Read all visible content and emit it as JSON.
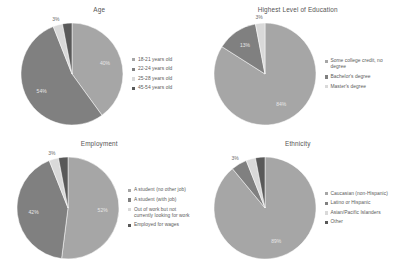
{
  "page": {
    "background": "#ffffff",
    "layout": "2x2 grid of pie charts"
  },
  "palette": {
    "series_1": "#a6a6a6",
    "series_2": "#808080",
    "series_3": "#d9d9d9",
    "series_4": "#595959",
    "title_color": "#555555",
    "legend_text_color": "#5a5a5a",
    "inside_label_color": "#e8e8e8",
    "outside_label_color": "#6a6a6a"
  },
  "charts": [
    {
      "id": "age",
      "title": "Age",
      "legend": [
        "18-21 years old",
        "22-24 years old",
        "25-28 years old",
        "45-54 years old"
      ],
      "labels": [
        "40%",
        "54%",
        "3%",
        ""
      ],
      "values": [
        40,
        54,
        3,
        3
      ]
    },
    {
      "id": "education",
      "title": "Highest Level of Education",
      "legend": [
        "Some college credit, no degree",
        "Bachelor's degree",
        "Master's degree"
      ],
      "labels": [
        "84%",
        "13%",
        "3%"
      ],
      "values": [
        84,
        13,
        3
      ]
    },
    {
      "id": "employment",
      "title": "Employment",
      "legend": [
        "A student (no other job)",
        "A student (with job)",
        "Out of work but not currently looking for work",
        "Employed for wages"
      ],
      "labels": [
        "52%",
        "42%",
        "3%",
        ""
      ],
      "values": [
        52,
        42,
        3,
        3
      ]
    },
    {
      "id": "ethnicity",
      "title": "Ethnicity",
      "legend": [
        "Caucasian (non-Hispanic)",
        "Latino or Hispanic",
        "Asian/Pacific Islanders",
        "Other"
      ],
      "labels": [
        "89%",
        "3%",
        "",
        ""
      ],
      "values": [
        89,
        5,
        3,
        3
      ]
    }
  ],
  "chart_data": [
    {
      "type": "pie",
      "title": "Age",
      "categories": [
        "18-21 years old",
        "22-24 years old",
        "25-28 years old",
        "45-54 years old"
      ],
      "values": [
        40,
        54,
        3,
        3
      ],
      "data_labels": [
        "40%",
        "54%",
        "3%",
        ""
      ],
      "legend_position": "right",
      "colors": [
        "#a6a6a6",
        "#808080",
        "#d9d9d9",
        "#595959"
      ]
    },
    {
      "type": "pie",
      "title": "Highest Level of Education",
      "categories": [
        "Some college credit, no degree",
        "Bachelor's degree",
        "Master's degree"
      ],
      "values": [
        84,
        13,
        3
      ],
      "data_labels": [
        "84%",
        "13%",
        "3%"
      ],
      "legend_position": "right",
      "colors": [
        "#a6a6a6",
        "#808080",
        "#d9d9d9"
      ]
    },
    {
      "type": "pie",
      "title": "Employment",
      "categories": [
        "A student (no other job)",
        "A student (with job)",
        "Out of work but not currently looking for work",
        "Employed for wages"
      ],
      "values": [
        52,
        42,
        3,
        3
      ],
      "data_labels": [
        "52%",
        "42%",
        "3%",
        ""
      ],
      "legend_position": "right",
      "colors": [
        "#a6a6a6",
        "#808080",
        "#d9d9d9",
        "#595959"
      ]
    },
    {
      "type": "pie",
      "title": "Ethnicity",
      "categories": [
        "Caucasian (non-Hispanic)",
        "Latino or Hispanic",
        "Asian/Pacific Islanders",
        "Other"
      ],
      "values": [
        89,
        5,
        3,
        3
      ],
      "data_labels": [
        "89%",
        "3%",
        "",
        ""
      ],
      "legend_position": "right",
      "colors": [
        "#a6a6a6",
        "#808080",
        "#d9d9d9",
        "#595959"
      ]
    }
  ]
}
